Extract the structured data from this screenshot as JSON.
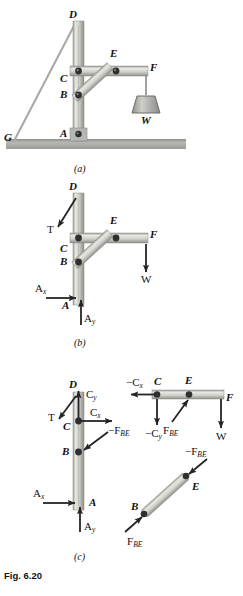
{
  "figure": {
    "caption": "Fig. 6.20",
    "panels": [
      {
        "id": "a",
        "label": "(a)",
        "title": "frame with pulley and weight"
      },
      {
        "id": "b",
        "label": "(b)",
        "title": "free-body diagram of entire frame"
      },
      {
        "id": "c",
        "label": "(c)",
        "title": "free-body diagrams of members"
      }
    ]
  },
  "panel_a": {
    "points": [
      "G",
      "D",
      "C",
      "B",
      "A",
      "E",
      "F"
    ],
    "labels": {
      "G": "G",
      "D": "D",
      "C": "C",
      "B": "B",
      "A": "A",
      "E": "E",
      "F": "F",
      "W": "W"
    }
  },
  "panel_b": {
    "labels": {
      "D": "D",
      "C": "C",
      "B": "B",
      "A": "A",
      "E": "E",
      "F": "F",
      "W": "W",
      "T": "T"
    },
    "forces": [
      {
        "name": "T",
        "symbol": "T",
        "dir": "down-left"
      },
      {
        "name": "W",
        "symbol": "W",
        "dir": "down"
      },
      {
        "name": "Ax",
        "symbol": "A",
        "sub": "x",
        "dir": "right"
      },
      {
        "name": "Ay",
        "symbol": "A",
        "sub": "y",
        "dir": "up"
      }
    ]
  },
  "panel_c": {
    "member_ACD": {
      "labels": {
        "D": "D",
        "C": "C",
        "B": "B",
        "A": "A"
      },
      "forces": [
        {
          "name": "T",
          "symbol": "T",
          "dir": "down-left"
        },
        {
          "name": "Cy",
          "symbol": "C",
          "sub": "y",
          "dir": "up"
        },
        {
          "name": "Cx",
          "symbol": "C",
          "sub": "x",
          "dir": "right"
        },
        {
          "name": "minus_FBE",
          "symbol": "−F",
          "sub": "BE",
          "dir": "down-left"
        },
        {
          "name": "Ax",
          "symbol": "A",
          "sub": "x",
          "dir": "right"
        },
        {
          "name": "Ay",
          "symbol": "A",
          "sub": "y",
          "dir": "up"
        }
      ]
    },
    "member_CEF": {
      "labels": {
        "C": "C",
        "E": "E",
        "F": "F"
      },
      "forces": [
        {
          "name": "minus_Cx",
          "symbol": "−C",
          "sub": "x",
          "dir": "left"
        },
        {
          "name": "minus_Cy",
          "symbol": "−C",
          "sub": "y",
          "dir": "down"
        },
        {
          "name": "FBE",
          "symbol": "F",
          "sub": "BE",
          "dir": "up-right"
        },
        {
          "name": "W",
          "symbol": "W",
          "dir": "down"
        }
      ]
    },
    "member_BE": {
      "labels": {
        "B": "B",
        "E": "E"
      },
      "forces": [
        {
          "name": "minus_FBE",
          "symbol": "−F",
          "sub": "BE",
          "dir": "down-left"
        },
        {
          "name": "FBE",
          "symbol": "F",
          "sub": "BE",
          "dir": "up-right"
        }
      ]
    }
  },
  "colors": {
    "member_light": "#d8d8d4",
    "member_mid": "#b9b9b4",
    "member_dark": "#8f8f8a",
    "ground": "#9c9c99",
    "pin": "#2b2b2b",
    "arrow": "#2a2a2a",
    "rope": "#6f6f6f",
    "weight": "#b0b0ac"
  }
}
